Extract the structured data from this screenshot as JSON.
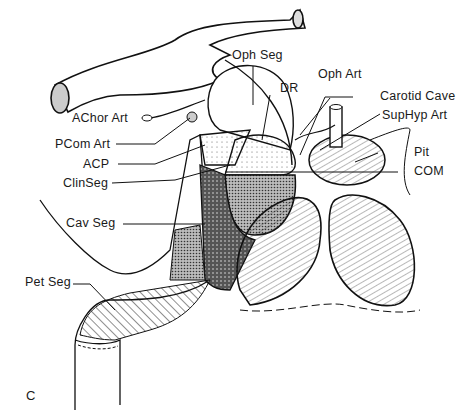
{
  "figure": {
    "panel_letter": "C",
    "labels": {
      "oph_seg": "Oph Seg",
      "oph_art": "Oph Art",
      "dr": "DR",
      "carotid_cave": "Carotid  Cave",
      "sup_hyp_art": "SupHyp Art",
      "achor_art": "AChor Art",
      "pcom_art": "PCom Art",
      "acp": "ACP",
      "clin_seg": "ClinSeg",
      "pit": "Pit",
      "com": "COM",
      "cav_seg": "Cav Seg",
      "pet_seg": "Pet Seg"
    },
    "colors": {
      "ink": "#1a1a1a",
      "background": "#ffffff"
    }
  }
}
